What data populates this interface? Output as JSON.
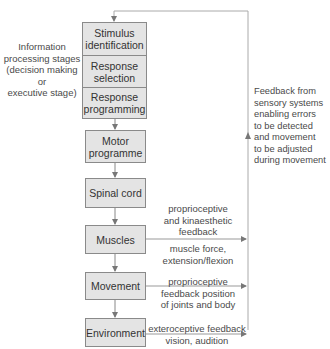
{
  "diagram": {
    "stages_label": [
      "Information",
      "processing stages",
      "(decision making",
      "or",
      "executive stage)"
    ],
    "processing_stack": [
      {
        "label_line1": "Stimulus",
        "label_line2": "identification"
      },
      {
        "label_line1": "Response",
        "label_line2": "selection"
      },
      {
        "label_line1": "Response",
        "label_line2": "programming"
      }
    ],
    "chain": [
      {
        "label_line1": "Motor",
        "label_line2": "programme"
      },
      {
        "label_line1": "Spinal cord",
        "label_line2": ""
      },
      {
        "label_line1": "Muscles",
        "label_line2": ""
      },
      {
        "label_line1": "Movement",
        "label_line2": ""
      },
      {
        "label_line1": "Environment",
        "label_line2": ""
      }
    ],
    "feedback_label": [
      "Feedback from",
      "sensory systems",
      "enabling errors",
      "to be detected",
      "and movement",
      "to be adjusted",
      "during movement"
    ],
    "muscles_feedback_above": [
      "proprioceptive",
      "and kinaesthetic",
      "feedback"
    ],
    "muscles_feedback_below": [
      "muscle force,",
      "extension/flexion"
    ],
    "movement_feedback": [
      "proprioceptive",
      "feedback position",
      "of joints and body"
    ],
    "environment_feedback": [
      "exteroceptive feedback",
      "vision, audition"
    ],
    "colors": {
      "box_fill": "#e4e4e4",
      "box_border": "#8a8a8a",
      "line": "#9a9a9a",
      "text": "#3a3a3a"
    }
  }
}
